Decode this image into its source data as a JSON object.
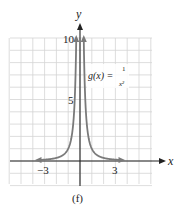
{
  "chart_data": {
    "type": "line",
    "title": "",
    "caption": "(f)",
    "function_label": "g(x) = 1/x²",
    "function_label_parts": {
      "lhs": "g(x) =",
      "num": "1",
      "den": "x²"
    },
    "xlabel": "x",
    "ylabel": "y",
    "xlim": [
      -6,
      6
    ],
    "ylim": [
      -2,
      10
    ],
    "x_ticks_labeled": [
      -3,
      3
    ],
    "y_ticks_labeled": [
      5,
      10
    ],
    "tick_labels": {
      "x_neg3": "−3",
      "x_pos3": "3",
      "y5": "5",
      "y10": "10"
    },
    "grid": true,
    "legend": "none",
    "series": [
      {
        "name": "g(x) = 1/x²",
        "color": "#7a7a7a",
        "x": [
          -3.5,
          -3,
          -2,
          -1.5,
          -1,
          -0.75,
          -0.5,
          -0.4,
          -0.32,
          0.32,
          0.4,
          0.5,
          0.75,
          1,
          1.5,
          2,
          3,
          3.5
        ],
        "y": [
          0.08,
          0.11,
          0.25,
          0.44,
          1,
          1.78,
          4,
          6.25,
          9.77,
          9.77,
          6.25,
          4,
          1.78,
          1,
          0.44,
          0.25,
          0.11,
          0.08
        ]
      }
    ],
    "asymptotes": {
      "vertical": 0,
      "horizontal": 0
    }
  },
  "colors": {
    "grid": "#d4d4d4",
    "axis": "#222222",
    "curve": "#7a7a7a"
  }
}
